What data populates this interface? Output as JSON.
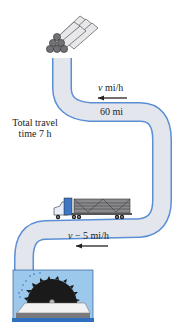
{
  "diagram": {
    "type": "road trip problem illustration",
    "start": {
      "label": "log pile",
      "icon": "log-pile-icon"
    },
    "end": {
      "label": "sawmill",
      "icon": "sawmill-icon"
    },
    "vehicle": {
      "label": "logging truck",
      "icon": "truck-icon"
    },
    "labels": {
      "speed_first": {
        "var": "v",
        "unit": " mi/h"
      },
      "distance": "60 mi",
      "total_time_line1": "Total travel",
      "total_time_line2": "time 7 h",
      "speed_second": {
        "var": "v",
        "rest": " − 5 mi/h"
      }
    },
    "colors": {
      "road_fill": "#e4e6ee",
      "road_edge": "#5b8fd4",
      "sawmill_box": "#9cc8ec",
      "sawmill_base": "#2f6fc0",
      "truck_cab": "#3d78c4",
      "blade": "#1a1a1a"
    }
  }
}
